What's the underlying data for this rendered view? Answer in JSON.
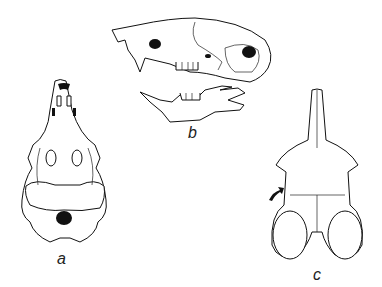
{
  "figure": {
    "panels": [
      {
        "label": "a",
        "view": "ventral skull view"
      },
      {
        "label": "b",
        "view": "lateral skull and mandible"
      },
      {
        "label": "c",
        "view": "dorsal skull view"
      }
    ],
    "colors": {
      "ink": "#111111",
      "background": "#ffffff"
    }
  }
}
